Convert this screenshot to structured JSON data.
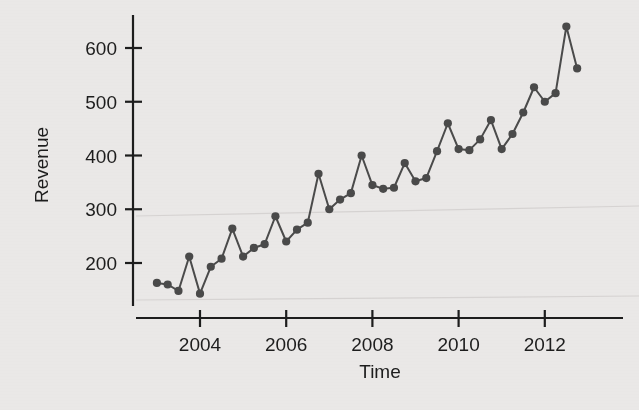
{
  "chart_data": {
    "type": "line",
    "title": "",
    "xlabel": "Time",
    "ylabel": "Revenue",
    "xlim": [
      2003.0,
      2013.0
    ],
    "ylim": [
      130,
      660
    ],
    "xticks": [
      2004,
      2006,
      2008,
      2010,
      2012
    ],
    "xtick_labels": [
      "2004",
      "2006",
      "2008",
      "2010",
      "2012"
    ],
    "yticks": [
      200,
      300,
      400,
      500,
      600
    ],
    "ytick_labels": [
      "200",
      "300",
      "400",
      "500",
      "600"
    ],
    "grid": false,
    "legend": null,
    "marker": "filled-circle",
    "series": [
      {
        "name": "Revenue",
        "x": [
          2003.0,
          2003.25,
          2003.5,
          2003.75,
          2004.0,
          2004.25,
          2004.5,
          2004.75,
          2005.0,
          2005.25,
          2005.5,
          2005.75,
          2006.0,
          2006.25,
          2006.5,
          2006.75,
          2007.0,
          2007.25,
          2007.5,
          2007.75,
          2008.0,
          2008.25,
          2008.5,
          2008.75,
          2009.0,
          2009.25,
          2009.5,
          2009.75,
          2010.0,
          2010.25,
          2010.5,
          2010.75,
          2011.0,
          2011.25,
          2011.5,
          2011.75,
          2012.0,
          2012.25,
          2012.5,
          2012.75
        ],
        "values": [
          163,
          160,
          148,
          212,
          143,
          193,
          208,
          264,
          212,
          228,
          235,
          287,
          240,
          262,
          275,
          366,
          300,
          318,
          330,
          400,
          345,
          338,
          340,
          386,
          352,
          358,
          408,
          460,
          412,
          410,
          430,
          466,
          412,
          440,
          480,
          527,
          500,
          516,
          640,
          562
        ]
      }
    ]
  },
  "axes": {
    "x_title": "Time",
    "y_title": "Revenue"
  },
  "colors": {
    "background": "#eceae9",
    "axis": "#1d1d1d",
    "line": "#4b4b4b",
    "marker": "#4a4a4a"
  }
}
